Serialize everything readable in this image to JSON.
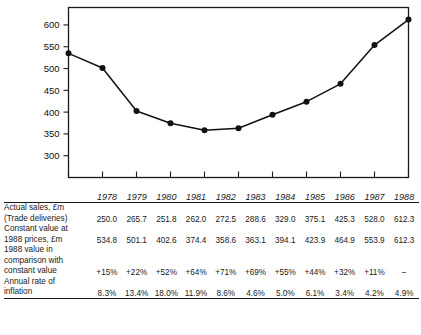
{
  "chart_data": {
    "type": "line",
    "title": "",
    "xlabel": "",
    "ylabel": "",
    "categories": [
      "1978",
      "1979",
      "1980",
      "1981",
      "1982",
      "1983",
      "1984",
      "1985",
      "1986",
      "1987",
      "1988"
    ],
    "series": [
      {
        "name": "Constant value at 1988 prices, £m",
        "values": [
          534.8,
          501.1,
          402.6,
          374.4,
          358.6,
          363.1,
          394.1,
          423.9,
          464.9,
          553.9,
          612.3
        ]
      }
    ],
    "ytick_labels": [
      "600",
      "550",
      "500",
      "450",
      "400",
      "350",
      "300"
    ],
    "ytick_values": [
      600,
      550,
      500,
      450,
      400,
      350,
      300
    ],
    "ylim": [
      250,
      640
    ],
    "xlim": [
      1978,
      1988
    ],
    "grid": false,
    "legend": "none",
    "marker": "filled-circle",
    "line_color": "#111111",
    "marker_color": "#111111"
  },
  "table": {
    "year_headers": [
      "1978",
      "1979",
      "1980",
      "1981",
      "1982",
      "1983",
      "1984",
      "1985",
      "1986",
      "1987",
      "1988"
    ],
    "rows": [
      {
        "label_lines": [
          "Actual sales, £m",
          "(Trade deliveries)"
        ],
        "values": [
          "250.0",
          "265.7",
          "251.8",
          "262.0",
          "272.5",
          "288.6",
          "329.0",
          "375.1",
          "425.3",
          "528.0",
          "612.3"
        ]
      },
      {
        "label_lines": [
          "Constant value at",
          "1988 prices, £m"
        ],
        "values": [
          "534.8",
          "501.1",
          "402.6",
          "374.4",
          "358.6",
          "363.1",
          "394.1",
          "423.9",
          "464.9",
          "553.9",
          "612.3"
        ]
      },
      {
        "label_lines": [
          "1988 value in",
          "comparison with",
          "constant value"
        ],
        "values": [
          "+15%",
          "+22%",
          "+52%",
          "+64%",
          "+71%",
          "+69%",
          "+55%",
          "+44%",
          "+32%",
          "+11%",
          "–"
        ]
      },
      {
        "label_lines": [
          "Annual rate of",
          "inflation"
        ],
        "values": [
          "8.3%",
          "13.4%",
          "18.0%",
          "11.9%",
          "8.6%",
          "4.6%",
          "5.0%",
          "6.1%",
          "3.4%",
          "4.2%",
          "4.9%"
        ]
      }
    ]
  }
}
